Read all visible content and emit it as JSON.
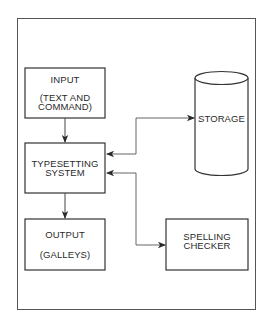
{
  "diagram": {
    "nodes": {
      "input": {
        "title": "INPUT",
        "subtitle_line1": "(TEXT AND",
        "subtitle_line2": "COMMAND)"
      },
      "typesetting": {
        "line1": "TYPESETTING",
        "line2": "SYSTEM"
      },
      "output": {
        "title": "OUTPUT",
        "subtitle": "(GALLEYS)"
      },
      "storage": {
        "title": "STORAGE",
        "shape": "cylinder"
      },
      "spelling": {
        "line1": "SPELLING",
        "line2": "CHECKER"
      }
    },
    "edges": [
      {
        "from": "INPUT",
        "to": "TYPESETTING SYSTEM",
        "direction": "one-way"
      },
      {
        "from": "TYPESETTING SYSTEM",
        "to": "OUTPUT",
        "direction": "one-way"
      },
      {
        "from": "TYPESETTING SYSTEM",
        "to": "STORAGE",
        "direction": "two-way"
      },
      {
        "from": "TYPESETTING SYSTEM",
        "to": "SPELLING CHECKER",
        "direction": "two-way"
      }
    ],
    "colors": {
      "line": "#3a3a3a",
      "background": "#ffffff"
    }
  }
}
